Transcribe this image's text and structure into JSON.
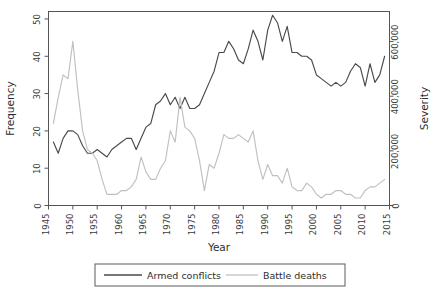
{
  "chart_data": {
    "type": "line",
    "title": "",
    "xlabel": "Year",
    "ylabel": "Frequency",
    "y2label": "Severity",
    "xlim": [
      1945,
      2015
    ],
    "ylim": [
      0,
      52
    ],
    "y2lim": [
      0,
      710000
    ],
    "grid": false,
    "legend_position": "bottom",
    "x_ticks": [
      "1945",
      "1950",
      "1955",
      "1960",
      "1965",
      "1970",
      "1975",
      "1980",
      "1985",
      "1990",
      "1995",
      "2000",
      "2005",
      "2010",
      "2015"
    ],
    "x_tick_values": [
      1945,
      1950,
      1955,
      1960,
      1965,
      1970,
      1975,
      1980,
      1985,
      1990,
      1995,
      2000,
      2005,
      2010,
      2015
    ],
    "y_ticks": [
      "0",
      "10",
      "20",
      "30",
      "40",
      "50"
    ],
    "y_tick_values": [
      0,
      10,
      20,
      30,
      40,
      50
    ],
    "y2_ticks": [
      "0",
      "200,000",
      "400,000",
      "600,000"
    ],
    "y2_tick_values": [
      0,
      200000,
      400000,
      600000
    ],
    "colors": {
      "armed_conflicts": "#4a4a4a",
      "battle_deaths": "#c0c0c0",
      "axis": "#555555",
      "background": "#ffffff"
    },
    "series": [
      {
        "name": "Armed conflicts",
        "axis": "left",
        "color": "#4a4a4a",
        "x": [
          1946,
          1947,
          1948,
          1949,
          1950,
          1951,
          1952,
          1953,
          1954,
          1955,
          1956,
          1957,
          1958,
          1959,
          1960,
          1961,
          1962,
          1963,
          1964,
          1965,
          1966,
          1967,
          1968,
          1969,
          1970,
          1971,
          1972,
          1973,
          1974,
          1975,
          1976,
          1977,
          1978,
          1979,
          1980,
          1981,
          1982,
          1983,
          1984,
          1985,
          1986,
          1987,
          1988,
          1989,
          1990,
          1991,
          1992,
          1993,
          1994,
          1995,
          1996,
          1997,
          1998,
          1999,
          2000,
          2001,
          2002,
          2003,
          2004,
          2005,
          2006,
          2007,
          2008,
          2009,
          2010,
          2011,
          2012,
          2013,
          2014
        ],
        "values": [
          17,
          14,
          18,
          20,
          20,
          19,
          16,
          14,
          14,
          15,
          14,
          13,
          15,
          16,
          17,
          18,
          18,
          15,
          18,
          21,
          22,
          27,
          28,
          30,
          27,
          29,
          26,
          29,
          26,
          26,
          27,
          30,
          33,
          36,
          41,
          41,
          44,
          42,
          39,
          38,
          42,
          47,
          44,
          39,
          47,
          51,
          49,
          44,
          48,
          41,
          41,
          40,
          40,
          39,
          35,
          34,
          33,
          32,
          33,
          32,
          33,
          36,
          38,
          37,
          32,
          38,
          33,
          35,
          40
        ]
      },
      {
        "name": "Battle deaths",
        "axis": "right",
        "color": "#c0c0c0",
        "x": [
          1946,
          1947,
          1948,
          1949,
          1950,
          1951,
          1952,
          1953,
          1954,
          1955,
          1956,
          1957,
          1958,
          1959,
          1960,
          1961,
          1962,
          1963,
          1964,
          1965,
          1966,
          1967,
          1968,
          1969,
          1970,
          1971,
          1972,
          1973,
          1974,
          1975,
          1976,
          1977,
          1978,
          1979,
          1980,
          1981,
          1982,
          1983,
          1984,
          1985,
          1986,
          1987,
          1988,
          1989,
          1990,
          1991,
          1992,
          1993,
          1994,
          1995,
          1996,
          1997,
          1998,
          1999,
          2000,
          2001,
          2002,
          2003,
          2004,
          2005,
          2006,
          2007,
          2008,
          2009,
          2010,
          2011,
          2012,
          2013,
          2014
        ],
        "values_frequency_scale": [
          22,
          29,
          35,
          34,
          44,
          31,
          20,
          15,
          14,
          12,
          7,
          3,
          3,
          3,
          4,
          4,
          5,
          7,
          13,
          9,
          7,
          7,
          10,
          12,
          20,
          17,
          29,
          21,
          20,
          18,
          12,
          4,
          11,
          10,
          14,
          19,
          18,
          18,
          19,
          18,
          17,
          20,
          12,
          7,
          11,
          8,
          8,
          6,
          10,
          5,
          4,
          4,
          6,
          5,
          3,
          2,
          3,
          3,
          4,
          4,
          3,
          3,
          2,
          2,
          4,
          5,
          5,
          6,
          7
        ],
        "values": [
          300000,
          395000,
          477000,
          464000,
          600000,
          423000,
          273000,
          205000,
          191000,
          164000,
          95000,
          41000,
          41000,
          41000,
          55000,
          55000,
          68000,
          95000,
          177000,
          123000,
          95000,
          95000,
          136000,
          164000,
          273000,
          232000,
          395000,
          286000,
          273000,
          245000,
          164000,
          55000,
          150000,
          136000,
          191000,
          259000,
          245000,
          245000,
          259000,
          245000,
          232000,
          273000,
          164000,
          95000,
          150000,
          109000,
          109000,
          82000,
          136000,
          68000,
          55000,
          55000,
          82000,
          68000,
          41000,
          27000,
          41000,
          41000,
          55000,
          55000,
          41000,
          41000,
          27000,
          27000,
          55000,
          68000,
          68000,
          82000,
          95000
        ]
      }
    ],
    "legend": [
      {
        "label": "Armed conflicts",
        "color": "#4a4a4a"
      },
      {
        "label": "Battle deaths",
        "color": "#c0c0c0"
      }
    ]
  }
}
